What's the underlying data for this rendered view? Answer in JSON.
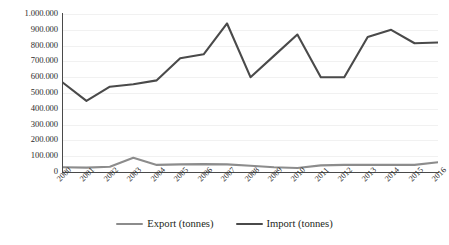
{
  "chart_data": {
    "type": "line",
    "title": "",
    "subtitle": "",
    "xlabel": "",
    "ylabel": "",
    "categories": [
      "2000",
      "2001",
      "2002",
      "2003",
      "2004",
      "2005",
      "2006",
      "2007",
      "2008",
      "2009",
      "2010",
      "2011",
      "2012",
      "2013",
      "2014",
      "2015",
      "2016"
    ],
    "ylim": [
      0,
      1000000
    ],
    "ytick_values": [
      0,
      100000,
      200000,
      300000,
      400000,
      500000,
      600000,
      700000,
      800000,
      900000,
      1000000
    ],
    "ytick_labels": [
      "0",
      "100.000",
      "200.000",
      "300.000",
      "400.000",
      "500.000",
      "600.000",
      "700.000",
      "800.000",
      "900.000",
      "1.000.000"
    ],
    "grid": true,
    "grid_axis": "y",
    "legend_position": "bottom",
    "xtick_rotation": -45,
    "series": [
      {
        "name": "Export (tonnes)",
        "color": "#8c8c8c",
        "values": [
          30000,
          28000,
          33000,
          90000,
          45000,
          48000,
          50000,
          48000,
          40000,
          30000,
          25000,
          42000,
          45000,
          45000,
          45000,
          45000,
          62000
        ]
      },
      {
        "name": "Import (tonnes)",
        "color": "#4a4a4a",
        "values": [
          565000,
          450000,
          540000,
          555000,
          580000,
          720000,
          745000,
          940000,
          600000,
          735000,
          870000,
          600000,
          600000,
          855000,
          900000,
          815000,
          820000
        ]
      }
    ]
  },
  "legend": {
    "items": [
      {
        "label": "Export (tonnes)",
        "color": "#8c8c8c"
      },
      {
        "label": "Import (tonnes)",
        "color": "#4a4a4a"
      }
    ]
  },
  "colors": {
    "axis": "#4a4a4a",
    "grid": "#f1f1f1",
    "text": "#231f20",
    "background": "#ffffff"
  }
}
